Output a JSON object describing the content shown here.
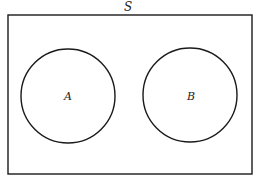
{
  "diagram": {
    "type": "venn",
    "universe": {
      "label": "S",
      "rect": {
        "x": 8,
        "y": 15,
        "width": 244,
        "height": 159
      }
    },
    "sets": [
      {
        "label": "A",
        "cx": 68,
        "cy": 96,
        "r": 47
      },
      {
        "label": "B",
        "cx": 190,
        "cy": 95,
        "r": 47
      }
    ],
    "relationship": "disjoint",
    "colors": {
      "stroke": "#1a1a1a",
      "background": "#ffffff"
    }
  }
}
